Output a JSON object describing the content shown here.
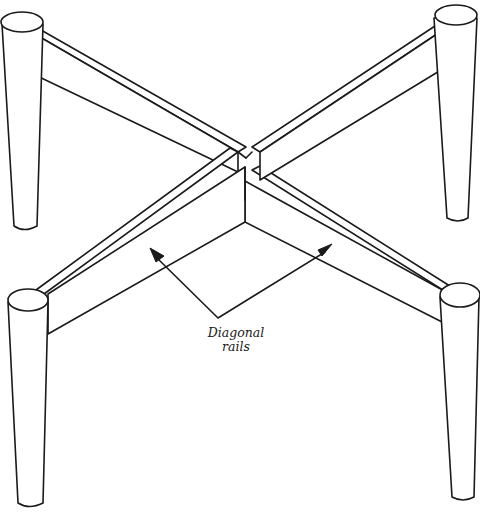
{
  "figure": {
    "callout": {
      "line1": "Diagonal",
      "line2": "rails"
    },
    "colors": {
      "ink": "#1a1a1a",
      "paper": "#ffffff"
    }
  }
}
